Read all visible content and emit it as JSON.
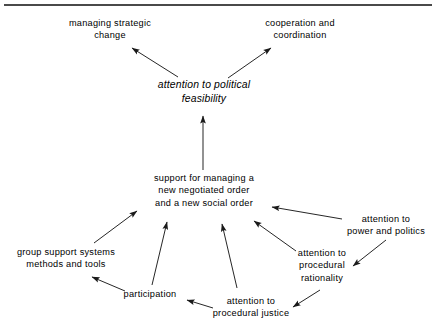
{
  "diagram": {
    "title_rule": "top-divider-rule",
    "stroke_color": "#1a1a1a",
    "text_color": "#000000",
    "background_color": "#ffffff",
    "nodes": [
      {
        "id": "managing-strategic-change",
        "label": "managing strategic\nchange",
        "x": 110,
        "y": 29,
        "italic": false
      },
      {
        "id": "cooperation-and-coordination",
        "label": "cooperation and\ncoordination",
        "x": 300,
        "y": 29,
        "italic": false
      },
      {
        "id": "attention-to-political-feasibility",
        "label": "attention to political\nfeasibility",
        "x": 204,
        "y": 92,
        "italic": true
      },
      {
        "id": "support-for-managing-new-order",
        "label": "support for managing a\nnew negotiated order\nand a new social order",
        "x": 204,
        "y": 191,
        "italic": false
      },
      {
        "id": "group-support-systems-methods-and-tools",
        "label": "group support systems\nmethods and tools",
        "x": 66,
        "y": 258,
        "italic": false
      },
      {
        "id": "participation",
        "label": "participation",
        "x": 150,
        "y": 294,
        "italic": false
      },
      {
        "id": "attention-to-procedural-justice",
        "label": "attention to\nprocedural justice",
        "x": 251,
        "y": 307,
        "italic": false
      },
      {
        "id": "attention-to-procedural-rationality",
        "label": "attention to\nprocedural\nrationality",
        "x": 322,
        "y": 266,
        "italic": false
      },
      {
        "id": "attention-to-power-and-politics",
        "label": "attention to\npower and politics",
        "x": 386,
        "y": 225,
        "italic": false
      }
    ],
    "edges": [
      {
        "id": "feasibility-to-managing-strategic-change",
        "from": "attention-to-political-feasibility",
        "to": "managing-strategic-change",
        "x1": 178,
        "y1": 77,
        "x2": 132,
        "y2": 48
      },
      {
        "id": "feasibility-to-cooperation-and-coordination",
        "from": "attention-to-political-feasibility",
        "to": "cooperation-and-coordination",
        "x1": 228,
        "y1": 78,
        "x2": 271,
        "y2": 48
      },
      {
        "id": "support-to-feasibility",
        "from": "support-for-managing-new-order",
        "to": "attention-to-political-feasibility",
        "x1": 203,
        "y1": 170,
        "x2": 203,
        "y2": 116
      },
      {
        "id": "group-support-to-support",
        "from": "group-support-systems-methods-and-tools",
        "to": "support-for-managing-new-order",
        "x1": 94,
        "y1": 243,
        "x2": 137,
        "y2": 211
      },
      {
        "id": "participation-to-group-support",
        "from": "participation",
        "to": "group-support-systems-methods-and-tools",
        "x1": 125,
        "y1": 291,
        "x2": 92,
        "y2": 277
      },
      {
        "id": "participation-to-support",
        "from": "participation",
        "to": "support-for-managing-new-order",
        "x1": 152,
        "y1": 285,
        "x2": 167,
        "y2": 222
      },
      {
        "id": "procedural-justice-to-support",
        "from": "attention-to-procedural-justice",
        "to": "support-for-managing-new-order",
        "x1": 237,
        "y1": 288,
        "x2": 222,
        "y2": 224
      },
      {
        "id": "procedural-justice-to-participation",
        "from": "attention-to-procedural-justice",
        "to": "participation",
        "x1": 213,
        "y1": 308,
        "x2": 187,
        "y2": 300
      },
      {
        "id": "procedural-rationality-to-support",
        "from": "attention-to-procedural-rationality",
        "to": "support-for-managing-new-order",
        "x1": 296,
        "y1": 251,
        "x2": 254,
        "y2": 221
      },
      {
        "id": "power-and-politics-to-support",
        "from": "attention-to-power-and-politics",
        "to": "support-for-managing-new-order",
        "x1": 342,
        "y1": 219,
        "x2": 272,
        "y2": 207
      },
      {
        "id": "power-and-politics-to-procedural-rationality",
        "from": "attention-to-power-and-politics",
        "to": "attention-to-procedural-rationality",
        "x1": 386,
        "y1": 240,
        "x2": 353,
        "y2": 266
      },
      {
        "id": "procedural-rationality-to-procedural-justice",
        "from": "attention-to-procedural-rationality",
        "to": "attention-to-procedural-justice",
        "x1": 320,
        "y1": 290,
        "x2": 293,
        "y2": 307
      }
    ]
  }
}
